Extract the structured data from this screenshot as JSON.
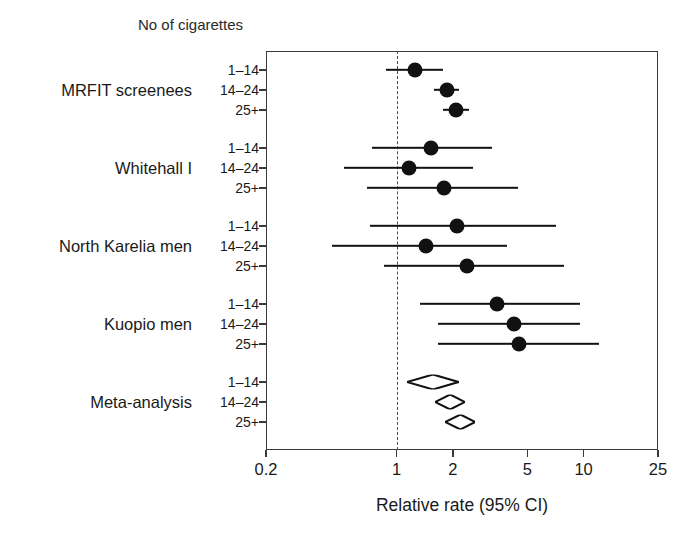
{
  "chart_data": {
    "type": "scatter",
    "subtype": "forest-plot",
    "title": "No of cigarettes",
    "xlabel": "Relative rate (95% CI)",
    "ylabel": "",
    "xscale": "log",
    "xlim": [
      0.2,
      25
    ],
    "xticks": [
      0.2,
      1,
      2,
      5,
      10,
      25
    ],
    "xticklabels": [
      "0.2",
      "1",
      "2",
      "5",
      "10",
      "25"
    ],
    "grid": false,
    "legend": null,
    "reference_line": 1,
    "dose_categories": [
      "1–14",
      "14–24",
      "25+"
    ],
    "groups": [
      {
        "name": "MRFIT screenees",
        "marker": "circle",
        "rows": [
          {
            "dose": "1–14",
            "estimate": 1.26,
            "ci_low": 0.88,
            "ci_high": 1.78
          },
          {
            "dose": "14–24",
            "estimate": 1.85,
            "ci_low": 1.58,
            "ci_high": 2.15
          },
          {
            "dose": "25+",
            "estimate": 2.08,
            "ci_low": 1.77,
            "ci_high": 2.43
          }
        ]
      },
      {
        "name": "Whitehall I",
        "marker": "circle",
        "rows": [
          {
            "dose": "1–14",
            "estimate": 1.53,
            "ci_low": 0.74,
            "ci_high": 3.25
          },
          {
            "dose": "14–24",
            "estimate": 1.17,
            "ci_low": 0.52,
            "ci_high": 2.56
          },
          {
            "dose": "25+",
            "estimate": 1.79,
            "ci_low": 0.69,
            "ci_high": 4.45
          }
        ]
      },
      {
        "name": "North Karelia men",
        "marker": "circle",
        "rows": [
          {
            "dose": "1–14",
            "estimate": 2.09,
            "ci_low": 0.72,
            "ci_high": 7.08
          },
          {
            "dose": "14–24",
            "estimate": 1.43,
            "ci_low": 0.45,
            "ci_high": 3.9
          },
          {
            "dose": "25+",
            "estimate": 2.39,
            "ci_low": 0.86,
            "ci_high": 7.85
          }
        ]
      },
      {
        "name": "Kuopio men",
        "marker": "circle",
        "rows": [
          {
            "dose": "1–14",
            "estimate": 3.46,
            "ci_low": 1.33,
            "ci_high": 9.55
          },
          {
            "dose": "14–24",
            "estimate": 4.25,
            "ci_low": 1.66,
            "ci_high": 9.55
          },
          {
            "dose": "25+",
            "estimate": 4.52,
            "ci_low": 1.66,
            "ci_high": 12.1
          }
        ]
      },
      {
        "name": "Meta-analysis",
        "marker": "diamond",
        "rows": [
          {
            "dose": "1–14",
            "estimate": 1.57,
            "ci_low": 1.14,
            "ci_high": 2.15
          },
          {
            "dose": "14–24",
            "estimate": 1.94,
            "ci_low": 1.61,
            "ci_high": 2.33
          },
          {
            "dose": "25+",
            "estimate": 2.19,
            "ci_low": 1.81,
            "ci_high": 2.63
          }
        ]
      }
    ]
  },
  "colors": {
    "marker": "#111111",
    "axis": "#3a3a3a",
    "reference": "#4a4a4a",
    "background": "#ffffff",
    "text": "#1a1a1a"
  }
}
